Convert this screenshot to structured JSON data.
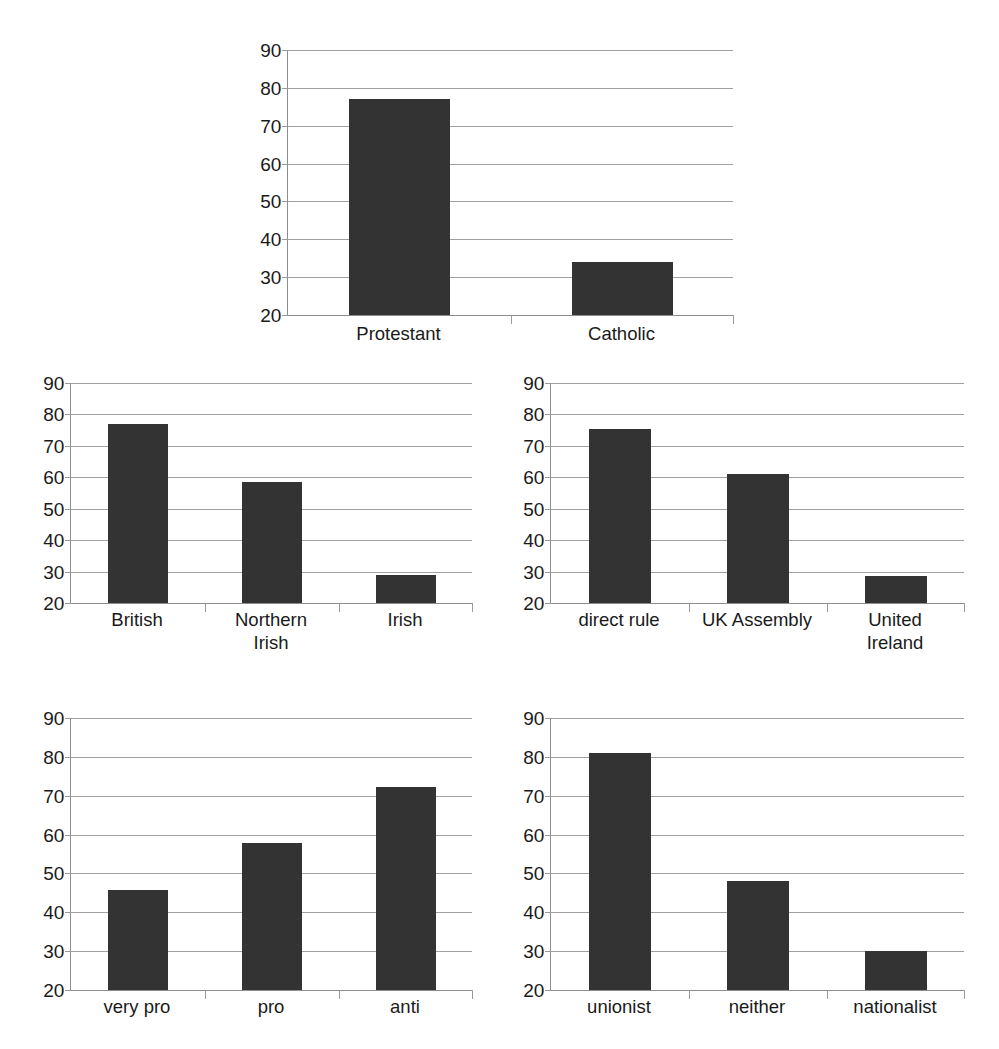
{
  "page": {
    "background_color": "#ffffff",
    "bar_color": "#333333",
    "gridline_color": "#a0a0a0",
    "axis_color": "#8d8d8d",
    "text_color": "#1a1a1a"
  },
  "chart_data": [
    {
      "id": "religion",
      "type": "bar",
      "title": "",
      "xlabel": "",
      "ylabel": "",
      "ylim": [
        20,
        90
      ],
      "yticks": [
        20,
        30,
        40,
        50,
        60,
        70,
        80,
        90
      ],
      "grid": true,
      "legend": "none",
      "categories": [
        "Protestant",
        "Catholic"
      ],
      "values": [
        77,
        34
      ]
    },
    {
      "id": "national-identity",
      "type": "bar",
      "title": "",
      "xlabel": "",
      "ylabel": "",
      "ylim": [
        20,
        90
      ],
      "yticks": [
        20,
        30,
        40,
        50,
        60,
        70,
        80,
        90
      ],
      "grid": true,
      "legend": "none",
      "categories": [
        "British",
        "Northern\nIrish",
        "Irish"
      ],
      "values": [
        77,
        58.5,
        29
      ]
    },
    {
      "id": "constitutional-preference",
      "type": "bar",
      "title": "",
      "xlabel": "",
      "ylabel": "",
      "ylim": [
        20,
        90
      ],
      "yticks": [
        20,
        30,
        40,
        50,
        60,
        70,
        80,
        90
      ],
      "grid": true,
      "legend": "none",
      "categories": [
        "direct rule",
        "UK Assembly",
        "United\nIreland"
      ],
      "values": [
        75.3,
        60.9,
        28.5
      ]
    },
    {
      "id": "agreement-stance",
      "type": "bar",
      "title": "",
      "xlabel": "",
      "ylabel": "",
      "ylim": [
        20,
        90
      ],
      "yticks": [
        20,
        30,
        40,
        50,
        60,
        70,
        80,
        90
      ],
      "grid": true,
      "legend": "none",
      "categories": [
        "very pro",
        "pro",
        "anti"
      ],
      "values": [
        45.7,
        57.8,
        72.3
      ]
    },
    {
      "id": "political-alignment",
      "type": "bar",
      "title": "",
      "xlabel": "",
      "ylabel": "",
      "ylim": [
        20,
        90
      ],
      "yticks": [
        20,
        30,
        40,
        50,
        60,
        70,
        80,
        90
      ],
      "grid": true,
      "legend": "none",
      "categories": [
        "unionist",
        "neither",
        "nationalist"
      ],
      "values": [
        81,
        48,
        30
      ]
    }
  ],
  "layout": {
    "panels": [
      {
        "chart": 0,
        "left": 247,
        "top": 50,
        "width": 486,
        "height": 265,
        "label_top": 272,
        "bar_width_ratio": 0.45
      },
      {
        "chart": 1,
        "left": 30,
        "top": 383,
        "width": 442,
        "height": 220,
        "label_top": 225,
        "bar_width_ratio": 0.45
      },
      {
        "chart": 2,
        "left": 510,
        "top": 383,
        "width": 454,
        "height": 220,
        "label_top": 225,
        "bar_width_ratio": 0.45
      },
      {
        "chart": 3,
        "left": 30,
        "top": 718,
        "width": 442,
        "height": 272,
        "label_top": 277,
        "bar_width_ratio": 0.45
      },
      {
        "chart": 4,
        "left": 510,
        "top": 718,
        "width": 454,
        "height": 272,
        "label_top": 277,
        "bar_width_ratio": 0.45
      }
    ]
  }
}
